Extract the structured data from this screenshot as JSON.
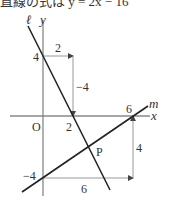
{
  "header": {
    "clipped_text": "直線の式は y = 2x − 16"
  },
  "axes": {
    "x_label": "x",
    "y_label": "y",
    "origin_label": "O"
  },
  "lines": {
    "l": {
      "name": "ℓ",
      "equation": "y = -2x + 4",
      "y_intercept": 4,
      "x_intercept": 2
    },
    "m": {
      "name": "m",
      "equation": "y = (2/3)x - 4",
      "y_intercept": -4,
      "x_intercept": 6
    }
  },
  "annotations": {
    "l_run": "2",
    "l_rise": "−4",
    "l_y_intercept": "4",
    "l_x_intercept": "2",
    "m_run": "6",
    "m_rise": "4",
    "m_y_intercept": "−4",
    "m_x_intercept": "6",
    "intersection": "P"
  },
  "colors": {
    "line": "#222222",
    "axis": "#888888",
    "guide": "#999999",
    "text": "#333333"
  }
}
